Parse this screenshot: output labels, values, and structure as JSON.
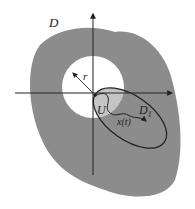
{
  "figure": {
    "labels": {
      "domain": "D",
      "radius": "r",
      "neighborhood": "U",
      "subdomain": "D",
      "subdomain_subscript": "1",
      "trajectory": "x(t)"
    },
    "colors": {
      "domain_fill": "#8c8c8c",
      "hole_fill": "#ffffff",
      "neighborhood_fill": "#c4c4c4",
      "lines": "#222222",
      "background": "#ffffff"
    }
  }
}
